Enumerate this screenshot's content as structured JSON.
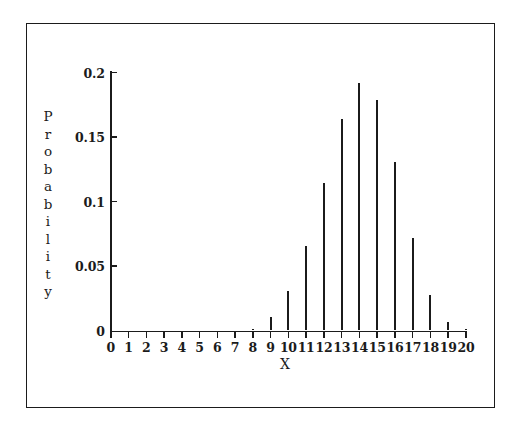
{
  "chart_data": {
    "type": "bar",
    "title": "",
    "subtitle": "",
    "xlabel": "X",
    "ylabel": "Probability",
    "ylabel_letters": [
      "P",
      "r",
      "o",
      "b",
      "a",
      "b",
      "i",
      "l",
      "i",
      "t",
      "y"
    ],
    "categories": [
      0,
      1,
      2,
      3,
      4,
      5,
      6,
      7,
      8,
      9,
      10,
      11,
      12,
      13,
      14,
      15,
      16,
      17,
      18,
      19,
      20
    ],
    "values": [
      0,
      0,
      0,
      0,
      0,
      0,
      0,
      0,
      0.001,
      0.0108,
      0.0308,
      0.0654,
      0.1144,
      0.1643,
      0.1916,
      0.1789,
      0.1304,
      0.0716,
      0.0278,
      0.0068,
      0.0008
    ],
    "xtick_labels": [
      "0",
      "1",
      "2",
      "3",
      "4",
      "5",
      "6",
      "7",
      "8",
      "9",
      "10",
      "11",
      "12",
      "13",
      "14",
      "15",
      "16",
      "17",
      "18",
      "19",
      "20"
    ],
    "ytick_labels": [
      "0",
      "0.05",
      "0.1",
      "0.15",
      "0.2"
    ],
    "ytick_values": [
      0,
      0.05,
      0.1,
      0.15,
      0.2
    ],
    "xlim": [
      0,
      20
    ],
    "ylim": [
      0,
      0.2
    ],
    "grid": false,
    "legend": null,
    "series_color": "#1b1b1b",
    "background_color": "#ffffff"
  }
}
